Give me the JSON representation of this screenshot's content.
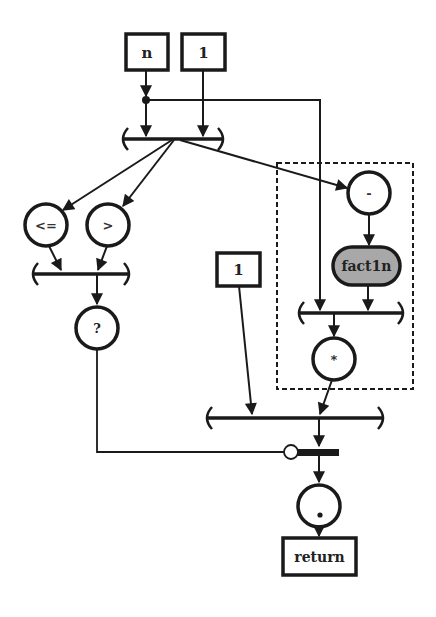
{
  "diagram": {
    "type": "dataflow-graph",
    "colors": {
      "stroke": "#1a1a1a",
      "background": "#ffffff",
      "subroutine_fill": "#a8a8a8"
    },
    "inputs": {
      "n": "n",
      "one_top": "1",
      "one_mid": "1"
    },
    "operators": {
      "le": "<=",
      "gt": ">",
      "cond": "?",
      "minus": "-",
      "mult": "*",
      "dot": "."
    },
    "subroutine": "fact1n",
    "output": "return"
  }
}
